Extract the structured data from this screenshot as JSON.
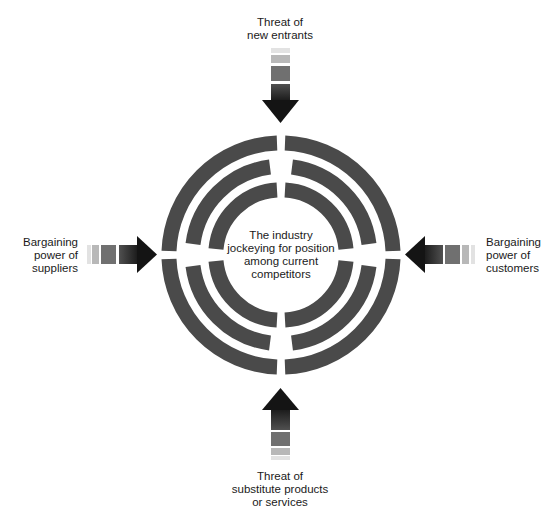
{
  "diagram": {
    "center": {
      "lines": [
        "The industry",
        "jockeying for position",
        "among current",
        "competitors"
      ]
    },
    "forces": {
      "top": {
        "lines": [
          "Threat of",
          "new entrants"
        ],
        "direction": "down"
      },
      "left": {
        "lines": [
          "Bargaining",
          "power of",
          "suppliers"
        ],
        "direction": "right"
      },
      "right": {
        "lines": [
          "Bargaining",
          "power of",
          "customers"
        ],
        "direction": "left"
      },
      "bottom": {
        "lines": [
          "Threat of",
          "substitute products",
          "or services"
        ],
        "direction": "up"
      }
    },
    "colors": {
      "ring": "#4a4a4a",
      "arrow_dark": "#1a1a1a",
      "arrow_mid": "#6e6e6e",
      "arrow_light": "#b4b4b4",
      "arrow_faint": "#e0e0e0"
    },
    "rings": 3
  }
}
